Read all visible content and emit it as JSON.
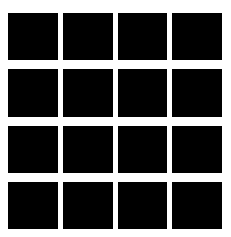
{
  "image": {
    "title": "Black square grid pattern",
    "width": 231,
    "height": 237,
    "background_color": "#ffffff"
  },
  "grid": {
    "rows": 4,
    "columns": 4,
    "cell_count": 16,
    "cell_color": "#000000",
    "gap_color": "#ffffff",
    "column_gap_px": 5,
    "row_gap_px": 9,
    "offset_left_px": 8,
    "offset_top_px": 13,
    "grid_width_px": 214,
    "grid_height_px": 216,
    "cell_width_px": 49,
    "cell_height_px": 45,
    "cells": [
      {
        "row": 1,
        "column": 1,
        "label": "r1c1"
      },
      {
        "row": 1,
        "column": 2,
        "label": "r1c2"
      },
      {
        "row": 1,
        "column": 3,
        "label": "r1c3"
      },
      {
        "row": 1,
        "column": 4,
        "label": "r1c4"
      },
      {
        "row": 2,
        "column": 1,
        "label": "r2c1"
      },
      {
        "row": 2,
        "column": 2,
        "label": "r2c2"
      },
      {
        "row": 2,
        "column": 3,
        "label": "r2c3"
      },
      {
        "row": 2,
        "column": 4,
        "label": "r2c4"
      },
      {
        "row": 3,
        "column": 1,
        "label": "r3c1"
      },
      {
        "row": 3,
        "column": 2,
        "label": "r3c2"
      },
      {
        "row": 3,
        "column": 3,
        "label": "r3c3"
      },
      {
        "row": 3,
        "column": 4,
        "label": "r3c4"
      },
      {
        "row": 4,
        "column": 1,
        "label": "r4c1"
      },
      {
        "row": 4,
        "column": 2,
        "label": "r4c2"
      },
      {
        "row": 4,
        "column": 3,
        "label": "r4c3"
      },
      {
        "row": 4,
        "column": 4,
        "label": "r4c4"
      }
    ]
  }
}
